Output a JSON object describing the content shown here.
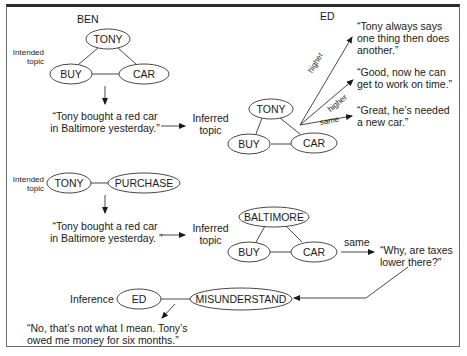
{
  "diagram": {
    "panel1": {
      "speaker_a": "BEN",
      "speaker_b": "ED",
      "intended_label": "Intended\ntopic",
      "intended_nodes": [
        "TONY",
        "BUY",
        "CAR"
      ],
      "utterance": "“Tony bought a red car\nin Baltimore yesterday.”",
      "inferred_label": "Inferred\ntopic",
      "inferred_nodes": [
        "TONY",
        "BUY",
        "CAR"
      ],
      "responses": [
        {
          "relation": "higher",
          "text": "“Tony always says\none thing then does\nanother.”"
        },
        {
          "relation": "higher",
          "text": "“Good, now he can\nget to work on time.”"
        },
        {
          "relation": "same",
          "text": "“Great, he’s needed\na new car.”"
        }
      ]
    },
    "panel2": {
      "intended_label": "Intended\ntopic",
      "intended_nodes": [
        "TONY",
        "PURCHASE"
      ],
      "utterance": "“Tony bought a red car\nin Baltimore yesterday. ”",
      "inferred_label": "Inferred\ntopic",
      "inferred_nodes": [
        "BALTIMORE",
        "BUY",
        "CAR"
      ],
      "response": {
        "relation": "same",
        "text": "“Why, are taxes\nlower there?”"
      },
      "inference_label": "Inference",
      "inference_nodes": [
        "ED",
        "MISUNDERSTAND"
      ],
      "reply": "“No, that’s not what I mean. Tony’s\nowed me money for six months.”"
    }
  }
}
